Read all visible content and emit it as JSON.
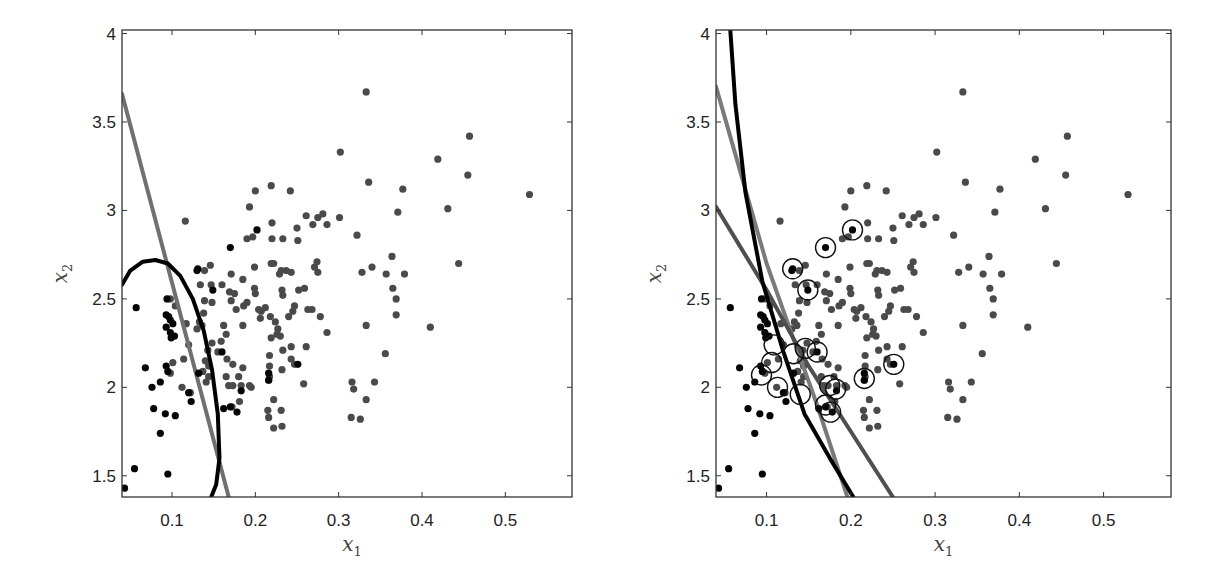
{
  "figure": {
    "panels": 2
  },
  "chart_data": [
    {
      "type": "scatter",
      "panel": "left",
      "title": "",
      "xlabel": "x_1",
      "ylabel": "x_2",
      "xlim": [
        0.04,
        0.58
      ],
      "ylim": [
        1.38,
        4.02
      ],
      "xticks": [
        0.1,
        0.2,
        0.3,
        0.4,
        0.5
      ],
      "xtick_labels": [
        "0.1",
        "0.2",
        "0.3",
        "0.4",
        "0.5"
      ],
      "yticks": [
        1.5,
        2,
        2.5,
        3,
        3.5,
        4
      ],
      "ytick_labels": [
        "1.5",
        "2",
        "2.5",
        "3",
        "3.5",
        "4"
      ],
      "grid": false,
      "legend": null,
      "series": [
        {
          "name": "class A (gray)",
          "color": "#4a4a4a",
          "ref": "points_gray"
        },
        {
          "name": "class B (black)",
          "color": "#000000",
          "ref": "points_black"
        }
      ],
      "curves": [
        {
          "name": "linear boundary",
          "color": "#707070",
          "width": 4,
          "points": [
            [
              0.04,
              3.66
            ],
            [
              0.168,
              1.38
            ]
          ]
        },
        {
          "name": "quadratic boundary (ellipse)",
          "color": "#000000",
          "width": 4,
          "points": [
            [
              0.04,
              2.58
            ],
            [
              0.05,
              2.66
            ],
            [
              0.065,
              2.71
            ],
            [
              0.08,
              2.72
            ],
            [
              0.095,
              2.7
            ],
            [
              0.11,
              2.63
            ],
            [
              0.125,
              2.5
            ],
            [
              0.138,
              2.32
            ],
            [
              0.148,
              2.1
            ],
            [
              0.155,
              1.85
            ],
            [
              0.157,
              1.6
            ],
            [
              0.153,
              1.45
            ],
            [
              0.147,
              1.38
            ]
          ]
        }
      ]
    },
    {
      "type": "scatter",
      "panel": "right",
      "title": "",
      "xlabel": "x_1",
      "ylabel": "x_2",
      "xlim": [
        0.04,
        0.58
      ],
      "ylim": [
        1.38,
        4.02
      ],
      "xticks": [
        0.1,
        0.2,
        0.3,
        0.4,
        0.5
      ],
      "xtick_labels": [
        "0.1",
        "0.2",
        "0.3",
        "0.4",
        "0.5"
      ],
      "yticks": [
        1.5,
        2,
        2.5,
        3,
        3.5,
        4
      ],
      "ytick_labels": [
        "1.5",
        "2",
        "2.5",
        "3",
        "3.5",
        "4"
      ],
      "grid": false,
      "legend": null,
      "series": [
        {
          "name": "class A (gray)",
          "color": "#4a4a4a",
          "ref": "points_gray"
        },
        {
          "name": "class B (black)",
          "color": "#000000",
          "ref": "points_black"
        },
        {
          "name": "circled (support vectors)",
          "marker": "open-circle",
          "ref": "circled"
        }
      ],
      "curves": [
        {
          "name": "light-gray boundary",
          "color": "#7a7a7a",
          "width": 4,
          "points": [
            [
              0.04,
              3.7
            ],
            [
              0.07,
              3.2
            ],
            [
              0.1,
              2.7
            ],
            [
              0.13,
              2.3
            ],
            [
              0.16,
              1.9
            ],
            [
              0.196,
              1.38
            ]
          ]
        },
        {
          "name": "dark-gray boundary",
          "color": "#4f4f4f",
          "width": 4,
          "points": [
            [
              0.04,
              3.02
            ],
            [
              0.1,
              2.55
            ],
            [
              0.15,
              2.12
            ],
            [
              0.2,
              1.75
            ],
            [
              0.25,
              1.38
            ]
          ]
        },
        {
          "name": "black boundary",
          "color": "#000000",
          "width": 4,
          "points": [
            [
              0.057,
              4.02
            ],
            [
              0.063,
              3.6
            ],
            [
              0.075,
              3.1
            ],
            [
              0.095,
              2.6
            ],
            [
              0.12,
              2.2
            ],
            [
              0.145,
              1.85
            ],
            [
              0.175,
              1.6
            ],
            [
              0.203,
              1.38
            ]
          ]
        }
      ]
    }
  ],
  "points_gray": [
    [
      0.333,
      3.67
    ],
    [
      0.302,
      3.33
    ],
    [
      0.457,
      3.42
    ],
    [
      0.419,
      3.29
    ],
    [
      0.455,
      3.2
    ],
    [
      0.336,
      3.16
    ],
    [
      0.377,
      3.12
    ],
    [
      0.529,
      3.09
    ],
    [
      0.431,
      3.01
    ],
    [
      0.371,
      2.99
    ],
    [
      0.301,
      2.96
    ],
    [
      0.261,
      2.97
    ],
    [
      0.275,
      2.96
    ],
    [
      0.281,
      2.98
    ],
    [
      0.269,
      2.92
    ],
    [
      0.286,
      2.92
    ],
    [
      0.193,
      3.02
    ],
    [
      0.2,
      3.11
    ],
    [
      0.219,
      3.14
    ],
    [
      0.242,
      3.11
    ],
    [
      0.25,
      2.9
    ],
    [
      0.251,
      2.83
    ],
    [
      0.22,
      2.93
    ],
    [
      0.22,
      2.84
    ],
    [
      0.233,
      2.84
    ],
    [
      0.19,
      2.84
    ],
    [
      0.116,
      2.94
    ],
    [
      0.322,
      2.86
    ],
    [
      0.364,
      2.74
    ],
    [
      0.34,
      2.68
    ],
    [
      0.328,
      2.65
    ],
    [
      0.357,
      2.64
    ],
    [
      0.379,
      2.64
    ],
    [
      0.444,
      2.7
    ],
    [
      0.365,
      2.56
    ],
    [
      0.369,
      2.5
    ],
    [
      0.369,
      2.41
    ],
    [
      0.41,
      2.34
    ],
    [
      0.333,
      2.35
    ],
    [
      0.356,
      2.19
    ],
    [
      0.343,
      2.03
    ],
    [
      0.316,
      2.03
    ],
    [
      0.318,
      1.99
    ],
    [
      0.333,
      1.93
    ],
    [
      0.315,
      1.83
    ],
    [
      0.326,
      1.82
    ],
    [
      0.286,
      2.31
    ],
    [
      0.278,
      2.4
    ],
    [
      0.274,
      2.71
    ],
    [
      0.275,
      2.65
    ],
    [
      0.271,
      2.68
    ],
    [
      0.268,
      2.44
    ],
    [
      0.263,
      2.44
    ],
    [
      0.259,
      2.56
    ],
    [
      0.252,
      2.55
    ],
    [
      0.245,
      2.43
    ],
    [
      0.247,
      2.46
    ],
    [
      0.24,
      2.4
    ],
    [
      0.237,
      2.66
    ],
    [
      0.231,
      2.66
    ],
    [
      0.229,
      2.64
    ],
    [
      0.243,
      2.65
    ],
    [
      0.219,
      2.7
    ],
    [
      0.222,
      2.7
    ],
    [
      0.232,
      2.55
    ],
    [
      0.233,
      2.52
    ],
    [
      0.207,
      2.43
    ],
    [
      0.212,
      2.45
    ],
    [
      0.218,
      2.4
    ],
    [
      0.224,
      2.37
    ],
    [
      0.227,
      2.33
    ],
    [
      0.23,
      2.29
    ],
    [
      0.226,
      2.3
    ],
    [
      0.219,
      2.28
    ],
    [
      0.243,
      2.23
    ],
    [
      0.233,
      2.21
    ],
    [
      0.261,
      2.23
    ],
    [
      0.243,
      2.16
    ],
    [
      0.247,
      2.13
    ],
    [
      0.217,
      2.18
    ],
    [
      0.217,
      2.12
    ],
    [
      0.232,
      2.1
    ],
    [
      0.217,
      2.06
    ],
    [
      0.216,
      2.04
    ],
    [
      0.258,
      2.02
    ],
    [
      0.222,
      1.93
    ],
    [
      0.231,
      1.87
    ],
    [
      0.215,
      1.87
    ],
    [
      0.216,
      1.83
    ],
    [
      0.222,
      1.77
    ],
    [
      0.232,
      1.78
    ],
    [
      0.197,
      2.85
    ],
    [
      0.199,
      2.68
    ],
    [
      0.185,
      2.61
    ],
    [
      0.171,
      2.64
    ],
    [
      0.2,
      2.53
    ],
    [
      0.19,
      2.48
    ],
    [
      0.186,
      2.46
    ],
    [
      0.175,
      2.53
    ],
    [
      0.169,
      2.54
    ],
    [
      0.16,
      2.58
    ],
    [
      0.171,
      2.49
    ],
    [
      0.177,
      2.44
    ],
    [
      0.185,
      2.35
    ],
    [
      0.162,
      2.35
    ],
    [
      0.165,
      2.3
    ],
    [
      0.159,
      2.26
    ],
    [
      0.155,
      2.2
    ],
    [
      0.166,
      2.16
    ],
    [
      0.173,
      2.13
    ],
    [
      0.185,
      2.11
    ],
    [
      0.18,
      2.06
    ],
    [
      0.165,
      2.06
    ],
    [
      0.168,
      2.01
    ],
    [
      0.173,
      2.01
    ],
    [
      0.183,
      2.01
    ],
    [
      0.193,
      2.01
    ],
    [
      0.195,
      2.0
    ],
    [
      0.181,
      1.92
    ],
    [
      0.172,
      1.89
    ],
    [
      0.146,
      2.69
    ],
    [
      0.139,
      2.66
    ],
    [
      0.134,
      2.58
    ],
    [
      0.147,
      2.58
    ],
    [
      0.148,
      2.48
    ],
    [
      0.139,
      2.49
    ],
    [
      0.138,
      2.42
    ],
    [
      0.133,
      2.37
    ],
    [
      0.136,
      2.35
    ],
    [
      0.13,
      2.33
    ],
    [
      0.148,
      2.25
    ],
    [
      0.143,
      2.21
    ],
    [
      0.14,
      2.15
    ],
    [
      0.144,
      2.12
    ],
    [
      0.137,
      2.09
    ],
    [
      0.144,
      2.06
    ],
    [
      0.141,
      2.03
    ],
    [
      0.117,
      2.36
    ],
    [
      0.12,
      2.24
    ],
    [
      0.114,
      2.16
    ],
    [
      0.101,
      2.14
    ],
    [
      0.098,
      2.08
    ],
    [
      0.112,
      2.0
    ],
    [
      0.122,
      1.97
    ],
    [
      0.104,
      2.46
    ],
    [
      0.098,
      2.5
    ],
    [
      0.199,
      2.56
    ],
    [
      0.204,
      2.44
    ],
    [
      0.206,
      2.39
    ]
  ],
  "points_black": [
    [
      0.043,
      1.43
    ],
    [
      0.055,
      1.54
    ],
    [
      0.057,
      2.45
    ],
    [
      0.068,
      2.11
    ],
    [
      0.076,
      2.0
    ],
    [
      0.078,
      1.88
    ],
    [
      0.086,
      1.74
    ],
    [
      0.086,
      2.03
    ],
    [
      0.092,
      1.85
    ],
    [
      0.093,
      2.12
    ],
    [
      0.095,
      2.09
    ],
    [
      0.095,
      1.51
    ],
    [
      0.104,
      1.84
    ],
    [
      0.094,
      2.5
    ],
    [
      0.093,
      2.41
    ],
    [
      0.096,
      2.4
    ],
    [
      0.098,
      2.38
    ],
    [
      0.101,
      2.36
    ],
    [
      0.093,
      2.34
    ],
    [
      0.098,
      2.31
    ],
    [
      0.103,
      2.29
    ],
    [
      0.099,
      2.28
    ],
    [
      0.12,
      1.97
    ],
    [
      0.123,
      1.92
    ],
    [
      0.132,
      2.08
    ],
    [
      0.13,
      2.66
    ],
    [
      0.131,
      2.67
    ],
    [
      0.149,
      2.55
    ],
    [
      0.17,
      2.79
    ],
    [
      0.202,
      2.89
    ],
    [
      0.216,
      2.08
    ],
    [
      0.216,
      2.04
    ],
    [
      0.251,
      2.13
    ],
    [
      0.16,
      2.2
    ],
    [
      0.17,
      1.89
    ],
    [
      0.178,
      1.86
    ],
    [
      0.183,
      1.98
    ],
    [
      0.162,
      1.88
    ]
  ],
  "circled": [
    [
      0.202,
      2.89
    ],
    [
      0.17,
      2.79
    ],
    [
      0.131,
      2.67
    ],
    [
      0.149,
      2.55
    ],
    [
      0.109,
      2.24
    ],
    [
      0.106,
      2.14
    ],
    [
      0.094,
      2.07
    ],
    [
      0.113,
      2.0
    ],
    [
      0.14,
      1.96
    ],
    [
      0.146,
      2.22
    ],
    [
      0.16,
      2.2
    ],
    [
      0.216,
      2.05
    ],
    [
      0.251,
      2.13
    ],
    [
      0.175,
      2.01
    ],
    [
      0.182,
      1.99
    ],
    [
      0.17,
      1.9
    ],
    [
      0.176,
      1.86
    ],
    [
      0.132,
      2.19
    ]
  ],
  "layout": {
    "left_frame": {
      "x0": 122,
      "x1": 572,
      "y0": 30,
      "y1": 497
    },
    "right_frame": {
      "x0": 716,
      "x1": 1171,
      "y0": 30,
      "y1": 497
    },
    "dot_gray_color": "#4a4a4a",
    "dot_black_color": "#050505",
    "frame_color": "#333333"
  }
}
